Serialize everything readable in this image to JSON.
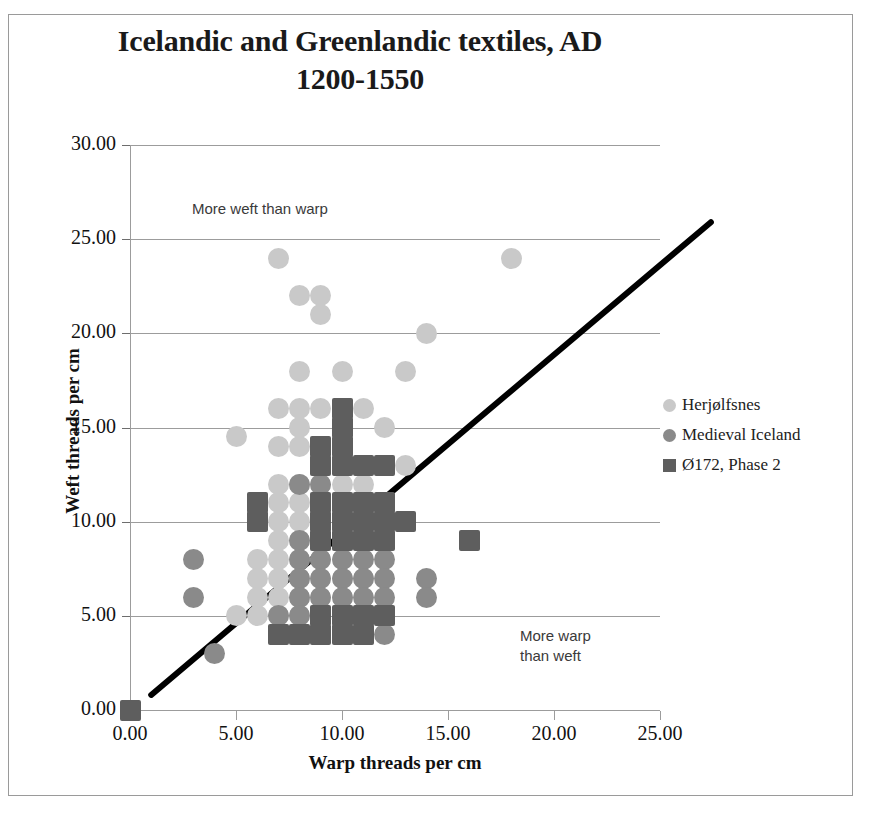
{
  "chart_data": {
    "type": "scatter",
    "title": "Icelandic and Greenlandic textiles, AD 1200-1550",
    "title_line1": "Icelandic and Greenlandic textiles, AD",
    "title_line2": "1200-1550",
    "xlabel": "Warp threads per cm",
    "ylabel": "Weft threads per cm",
    "xlim": [
      0,
      25
    ],
    "ylim": [
      0,
      30
    ],
    "xticks": [
      "0.00",
      "5.00",
      "10.00",
      "15.00",
      "20.00",
      "25.00"
    ],
    "xtick_values": [
      0,
      5,
      10,
      15,
      20,
      25
    ],
    "yticks": [
      "0.00",
      "5.00",
      "10.00",
      "15.00",
      "20.00",
      "25.00",
      "30.00"
    ],
    "ytick_values": [
      0,
      5,
      10,
      15,
      20,
      25,
      30
    ],
    "grid": "horizontal",
    "legend_position": "right",
    "annotations": [
      {
        "name": "more-weft-than-warp",
        "text": "More weft than warp",
        "x": 3.3,
        "y": 26.2
      },
      {
        "name": "more-warp-than-weft",
        "text": "More warp\nthan weft",
        "x": 20.9,
        "y": 4.5
      }
    ],
    "reference_line": {
      "name": "one-to-one-line",
      "label": "1:1 diagonal reference line",
      "color": "#000000",
      "width_px": 6,
      "from": [
        1.0,
        0.8
      ],
      "to": [
        27.4,
        25.9
      ]
    },
    "series": [
      {
        "name": "Herjølfsnes",
        "marker": "circle",
        "color": "#c9c9c9",
        "points": [
          [
            7,
            24
          ],
          [
            18,
            24
          ],
          [
            8,
            22
          ],
          [
            9,
            22
          ],
          [
            9,
            21
          ],
          [
            8,
            18
          ],
          [
            10,
            18
          ],
          [
            13,
            18
          ],
          [
            14,
            20
          ],
          [
            5,
            14.5
          ],
          [
            7,
            16
          ],
          [
            8,
            16
          ],
          [
            9,
            16
          ],
          [
            11,
            16
          ],
          [
            8,
            15
          ],
          [
            12,
            15
          ],
          [
            7,
            14
          ],
          [
            8,
            14
          ],
          [
            9,
            13
          ],
          [
            13,
            13
          ],
          [
            7,
            12
          ],
          [
            8,
            12
          ],
          [
            9,
            12
          ],
          [
            10,
            12
          ],
          [
            11,
            12
          ],
          [
            6,
            11
          ],
          [
            7,
            11
          ],
          [
            8,
            11
          ],
          [
            9,
            11
          ],
          [
            10,
            11
          ],
          [
            6,
            10
          ],
          [
            7,
            10
          ],
          [
            8,
            10
          ],
          [
            9,
            10
          ],
          [
            10,
            10
          ],
          [
            11,
            10
          ],
          [
            7,
            9
          ],
          [
            8,
            9
          ],
          [
            9,
            9
          ],
          [
            10,
            9
          ],
          [
            11,
            9
          ],
          [
            6,
            8
          ],
          [
            7,
            8
          ],
          [
            8,
            8
          ],
          [
            9,
            8
          ],
          [
            10,
            8
          ],
          [
            6,
            7
          ],
          [
            7,
            7
          ],
          [
            8,
            7
          ],
          [
            9,
            7
          ],
          [
            10,
            7
          ],
          [
            11,
            7
          ],
          [
            6,
            6
          ],
          [
            7,
            6
          ],
          [
            8,
            6
          ],
          [
            9,
            6
          ],
          [
            10,
            6
          ],
          [
            5,
            5
          ],
          [
            6,
            5
          ],
          [
            7,
            5
          ],
          [
            8,
            5
          ],
          [
            9,
            5
          ],
          [
            10,
            5
          ],
          [
            11,
            5
          ],
          [
            8,
            4
          ],
          [
            9,
            4
          ],
          [
            10,
            4
          ]
        ]
      },
      {
        "name": "Medieval Iceland",
        "marker": "circle",
        "color": "#8a8a8a",
        "points": [
          [
            3,
            8
          ],
          [
            3,
            6
          ],
          [
            4,
            3
          ],
          [
            12,
            13
          ],
          [
            8,
            12
          ],
          [
            9,
            12
          ],
          [
            10,
            10
          ],
          [
            11,
            10
          ],
          [
            12,
            10
          ],
          [
            8,
            9
          ],
          [
            9,
            9
          ],
          [
            10,
            9
          ],
          [
            11,
            9
          ],
          [
            12,
            9
          ],
          [
            8,
            8
          ],
          [
            9,
            8
          ],
          [
            10,
            8
          ],
          [
            11,
            8
          ],
          [
            12,
            8
          ],
          [
            8,
            7
          ],
          [
            9,
            7
          ],
          [
            10,
            7
          ],
          [
            11,
            7
          ],
          [
            12,
            7
          ],
          [
            14,
            7
          ],
          [
            8,
            6
          ],
          [
            9,
            6
          ],
          [
            10,
            6
          ],
          [
            11,
            6
          ],
          [
            12,
            6
          ],
          [
            14,
            6
          ],
          [
            7,
            5
          ],
          [
            8,
            5
          ],
          [
            9,
            5
          ],
          [
            10,
            5
          ],
          [
            11,
            5
          ],
          [
            12,
            5
          ],
          [
            8,
            4
          ],
          [
            9,
            4
          ],
          [
            10,
            4
          ],
          [
            11,
            4
          ],
          [
            12,
            4
          ]
        ]
      },
      {
        "name": "Ø172, Phase 2",
        "marker": "square",
        "color": "#5e5e5e",
        "points": [
          [
            0,
            0
          ],
          [
            10,
            16
          ],
          [
            10,
            15
          ],
          [
            9,
            14
          ],
          [
            10,
            14
          ],
          [
            9,
            13
          ],
          [
            10,
            13
          ],
          [
            11,
            13
          ],
          [
            12,
            13
          ],
          [
            6,
            11
          ],
          [
            9,
            11
          ],
          [
            10,
            11
          ],
          [
            11,
            11
          ],
          [
            12,
            11
          ],
          [
            6,
            10
          ],
          [
            9,
            10
          ],
          [
            10,
            10
          ],
          [
            11,
            10
          ],
          [
            12,
            10
          ],
          [
            13,
            10
          ],
          [
            9,
            9
          ],
          [
            10,
            9
          ],
          [
            11,
            9
          ],
          [
            12,
            9
          ],
          [
            16,
            9
          ],
          [
            9,
            5
          ],
          [
            10,
            5
          ],
          [
            11,
            5
          ],
          [
            12,
            5
          ],
          [
            7,
            4
          ],
          [
            8,
            4
          ],
          [
            9,
            4
          ],
          [
            10,
            4
          ],
          [
            11,
            4
          ]
        ]
      }
    ]
  },
  "legend": {
    "items": [
      {
        "label": "Herjølfsnes",
        "marker": "circle",
        "color": "#c9c9c9"
      },
      {
        "label": "Medieval Iceland",
        "marker": "circle",
        "color": "#8a8a8a"
      },
      {
        "label": "Ø172, Phase 2",
        "marker": "square",
        "color": "#5e5e5e"
      }
    ]
  }
}
